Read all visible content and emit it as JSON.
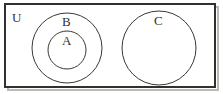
{
  "figure": {
    "kind": "venn-diagram",
    "width": 223,
    "height": 94,
    "background_color": "#ffffff",
    "stroke_color": "#33312f",
    "shadow_color": "#bdbab6"
  },
  "universe": {
    "label": "U",
    "shape": "rectangle",
    "x": 5,
    "y": 4,
    "width": 210,
    "height": 83,
    "stroke_width": 2
  },
  "sets": [
    {
      "label": "B",
      "shape": "circle",
      "cx": 67,
      "cy": 48,
      "r": 35,
      "stroke_width": 1,
      "fill": "none",
      "contains": "A"
    },
    {
      "label": "A",
      "shape": "circle",
      "cx": 67,
      "cy": 50,
      "r": 19,
      "stroke_width": 1,
      "fill": "none",
      "contains": null
    },
    {
      "label": "C",
      "shape": "circle",
      "cx": 159,
      "cy": 48,
      "r": 37,
      "stroke_width": 1,
      "fill": "none",
      "contains": null
    }
  ],
  "relations": {
    "a_subset_of_b": true,
    "c_disjoint_from_a_and_b": true,
    "all_within_universe": true
  }
}
